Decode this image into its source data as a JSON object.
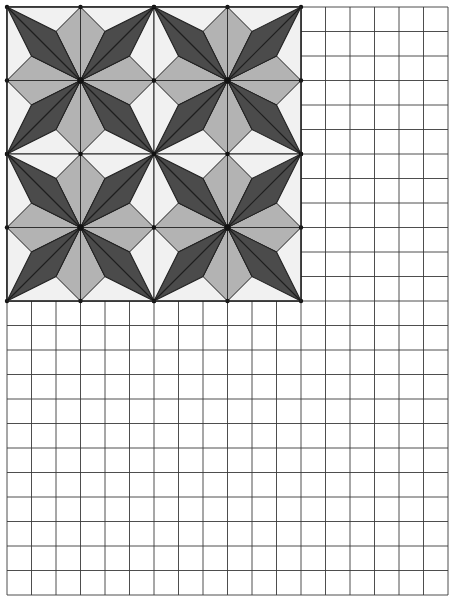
{
  "worksheet": {
    "grid": {
      "origin_x": 7,
      "origin_y": 7,
      "cell_size": 24.5,
      "columns": 18,
      "rows": 24,
      "line_color": "#3a3a3a",
      "line_width": 0.9,
      "background": "#ffffff"
    },
    "pattern": {
      "origin_x": 7,
      "origin_y": 7,
      "tile_size": 147,
      "tiles_across": 2,
      "tiles_down": 2,
      "cells_per_tile": 6,
      "colors": {
        "background": "#f1f1f1",
        "dark_kite": "#4b4b4b",
        "dark_kite_center_line": "#1e1e1e",
        "light_kite": "#b3b3b3",
        "outline": "#222222",
        "vertex_dot": "#111111"
      },
      "kite_side_fraction": 0.33,
      "description": "8-point star tiling: dark kites point to tile corners, light kites point to edge midpoints"
    }
  }
}
